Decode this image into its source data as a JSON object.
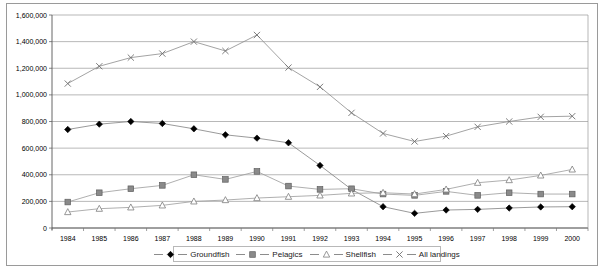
{
  "chart_data": {
    "type": "line",
    "title": "",
    "xlabel": "",
    "ylabel": "",
    "x": [
      1984,
      1985,
      1986,
      1987,
      1988,
      1989,
      1990,
      1991,
      1992,
      1993,
      1994,
      1995,
      1996,
      1997,
      1998,
      1999,
      2000
    ],
    "categories": [
      "1984",
      "1985",
      "1986",
      "1987",
      "1988",
      "1989",
      "1990",
      "1991",
      "1992",
      "1993",
      "1994",
      "1995",
      "1996",
      "1997",
      "1998",
      "1999",
      "2000"
    ],
    "ylim": [
      0,
      1600000
    ],
    "yticks": [
      0,
      200000,
      400000,
      600000,
      800000,
      1000000,
      1200000,
      1400000,
      1600000
    ],
    "ytick_labels": [
      "0",
      "200,000",
      "400,000",
      "600,000",
      "800,000",
      "1,000,000",
      "1,200,000",
      "1,400,000",
      "1,600,000"
    ],
    "grid": true,
    "legend_position": "bottom",
    "series": [
      {
        "name": "Groundfish",
        "marker": "diamond",
        "color": "#000000",
        "line_color": "#808080",
        "values": [
          740000,
          780000,
          800000,
          785000,
          745000,
          700000,
          675000,
          640000,
          470000,
          290000,
          160000,
          110000,
          135000,
          140000,
          150000,
          158000,
          160000
        ]
      },
      {
        "name": "Pelagics",
        "marker": "square",
        "color": "#7f7f7f",
        "line_color": "#9a9a9a",
        "values": [
          195000,
          265000,
          295000,
          320000,
          400000,
          365000,
          425000,
          315000,
          290000,
          295000,
          255000,
          245000,
          275000,
          245000,
          265000,
          255000,
          255000
        ]
      },
      {
        "name": "Shellfish",
        "marker": "triangle",
        "color": "#808080",
        "line_color": "#9a9a9a",
        "values": [
          120000,
          145000,
          155000,
          170000,
          200000,
          210000,
          225000,
          235000,
          245000,
          260000,
          265000,
          255000,
          290000,
          340000,
          360000,
          395000,
          440000
        ]
      },
      {
        "name": "All landings",
        "marker": "x",
        "color": "#7a7a7a",
        "line_color": "#8c8c8c",
        "values": [
          1085000,
          1215000,
          1280000,
          1310000,
          1400000,
          1330000,
          1450000,
          1205000,
          1060000,
          865000,
          710000,
          650000,
          690000,
          760000,
          800000,
          835000,
          840000
        ]
      }
    ]
  },
  "legend": {
    "items": [
      {
        "label": "Groundfish",
        "marker": "diamond"
      },
      {
        "label": "Pelagics",
        "marker": "square"
      },
      {
        "label": "Shellfish",
        "marker": "triangle"
      },
      {
        "label": "All landings",
        "marker": "x"
      }
    ]
  }
}
